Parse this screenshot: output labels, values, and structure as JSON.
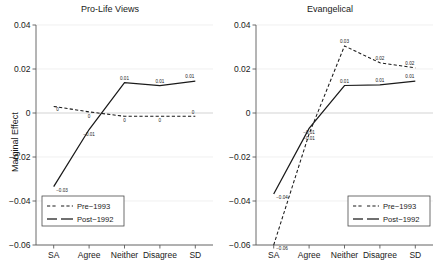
{
  "figure": {
    "width": 440,
    "height": 273,
    "background": "#ffffff",
    "line_color": "#1a1a1a"
  },
  "axis": {
    "ylabel": "Marginal Effect",
    "ytick_labels": [
      "0.04",
      "0.02",
      "0",
      "-0.02",
      "-0.04",
      "-0.06"
    ],
    "ytick_values": [
      0.04,
      0.02,
      0,
      -0.02,
      -0.04,
      -0.06
    ],
    "categories": [
      "SA",
      "Agree",
      "Neither",
      "Disagree",
      "SD"
    ]
  },
  "legend": {
    "pre_label": "Pre−1993",
    "post_label": "Post−1992"
  },
  "chart_data": [
    {
      "type": "line",
      "title": "Pro-Life Views",
      "xlabel": "",
      "ylabel": "Marginal Effect",
      "categories": [
        "SA",
        "Agree",
        "Neither",
        "Disagree",
        "SD"
      ],
      "ylim": [
        -0.06,
        0.04
      ],
      "yticks": [
        -0.06,
        -0.04,
        -0.02,
        0,
        0.02,
        0.04
      ],
      "grid": true,
      "legend_position": "lower-left",
      "series": [
        {
          "name": "Pre−1993",
          "style": "dashed",
          "values": [
            0.003,
            0.0005,
            -0.0015,
            -0.0015,
            -0.0015
          ],
          "point_labels": [
            "0",
            "0",
            "0",
            "0",
            "0"
          ]
        },
        {
          "name": "Post−1992",
          "style": "solid",
          "values": [
            -0.0335,
            -0.0075,
            0.0138,
            0.0125,
            0.0145
          ],
          "point_labels": [
            "-0.03",
            "-0.01",
            "0.01",
            "0.01",
            "0.01"
          ]
        }
      ]
    },
    {
      "type": "line",
      "title": "Evangelical",
      "xlabel": "",
      "ylabel": "Marginal Effect",
      "categories": [
        "SA",
        "Agree",
        "Neither",
        "Disagree",
        "SD"
      ],
      "ylim": [
        -0.06,
        0.04
      ],
      "yticks": [
        -0.06,
        -0.04,
        -0.02,
        0,
        0.02,
        0.04
      ],
      "grid": true,
      "legend_position": "lower-right",
      "series": [
        {
          "name": "Pre−1993",
          "style": "dashed",
          "values": [
            -0.06,
            -0.0095,
            0.0305,
            0.0228,
            0.0205
          ],
          "point_labels": [
            "-0.06",
            "-0.01",
            "0.03",
            "0.02",
            "0.02"
          ]
        },
        {
          "name": "Post−1992",
          "style": "solid",
          "values": [
            -0.0368,
            -0.007,
            0.0125,
            0.0128,
            0.0145
          ],
          "point_labels": [
            "-0.04",
            "-0.01",
            "0.01",
            "0.01",
            "0.01"
          ]
        }
      ]
    }
  ]
}
